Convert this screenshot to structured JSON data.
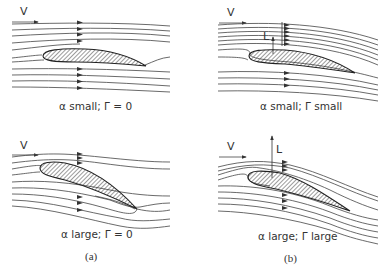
{
  "figure": {
    "panels": [
      {
        "id": "a-top",
        "velocity_label": "V",
        "caption": "α small;  Γ = 0",
        "lift_label": null
      },
      {
        "id": "b-top",
        "velocity_label": "V",
        "caption": "α small;  Γ small",
        "lift_label": "L"
      },
      {
        "id": "a-bottom",
        "velocity_label": "V",
        "caption": "α large;  Γ = 0",
        "lift_label": null
      },
      {
        "id": "b-bottom",
        "velocity_label": "V",
        "caption": "α large;  Γ large",
        "lift_label": "L"
      }
    ],
    "sublabels": {
      "a": "(a)",
      "b": "(b)"
    },
    "colors": {
      "line": "#3a3a3a",
      "hatch": "#3a3a3a",
      "background": "#ffffff"
    }
  }
}
